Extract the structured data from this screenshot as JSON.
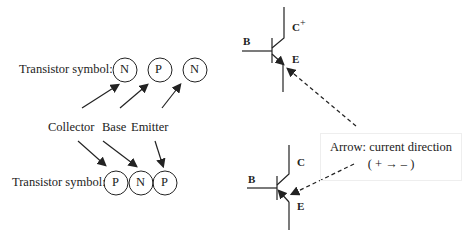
{
  "npn_row": {
    "label": "Transistor symbol:",
    "layers": [
      "N",
      "P",
      "N"
    ]
  },
  "terminals": {
    "collector": "Collector",
    "base": "Base",
    "emitter": "Emitter"
  },
  "pnp_row": {
    "label": "Transistor symbol:",
    "layers": [
      "P",
      "N",
      "P"
    ]
  },
  "npn_symbol": {
    "base": "B",
    "collector": "C",
    "collector_sup": "+",
    "emitter": "E"
  },
  "pnp_symbol": {
    "base": "B",
    "collector": "C",
    "emitter": "E"
  },
  "note": {
    "line1": "Arrow: current direction",
    "line2": "( + → – )"
  }
}
